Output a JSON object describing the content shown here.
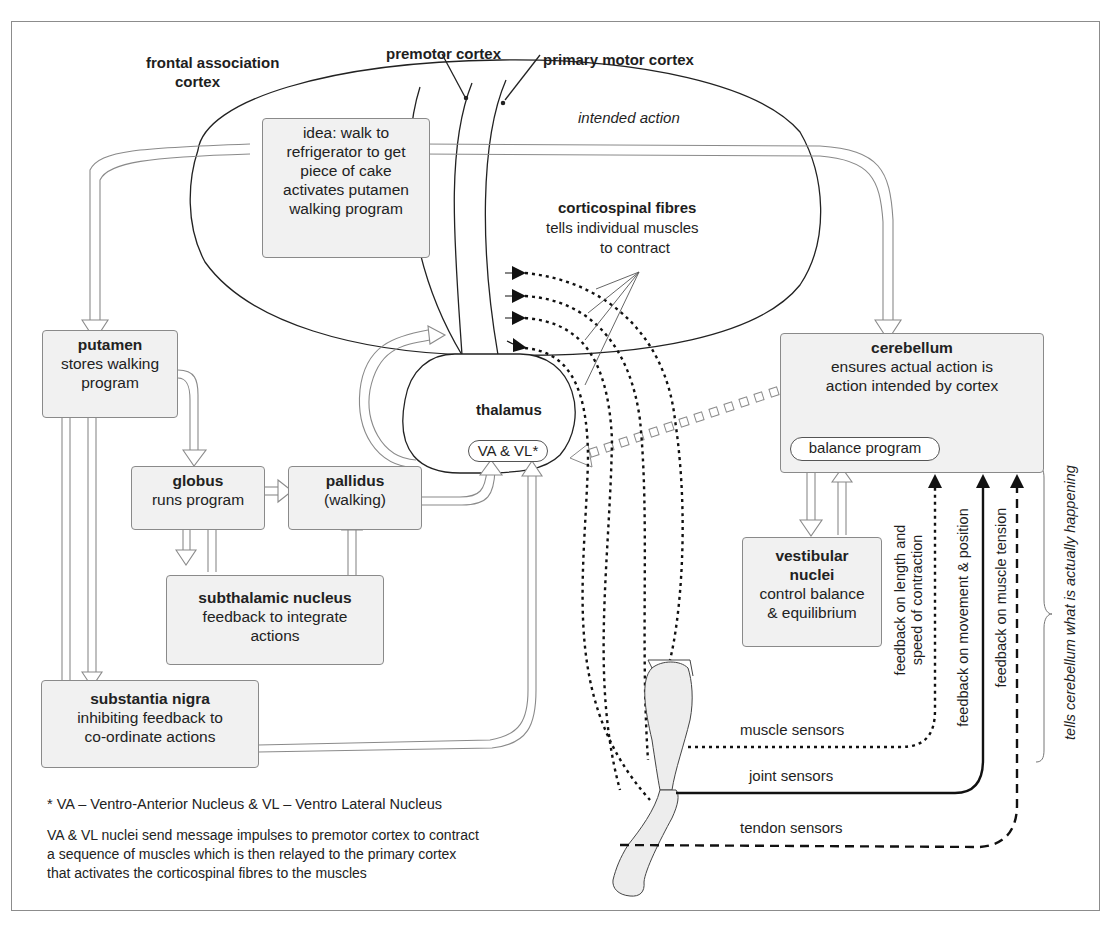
{
  "labels": {
    "frontal_association_cortex": [
      "frontal association",
      "cortex"
    ],
    "premotor_cortex": "premotor cortex",
    "primary_motor_cortex": "primary motor cortex",
    "intended_action": "intended action",
    "corticospinal_title": "corticospinal fibres",
    "corticospinal_desc": [
      "tells individual muscles",
      "to contract"
    ],
    "thalamus": "thalamus",
    "va_vl": "VA & VL*",
    "balance_program": "balance program",
    "muscle_sensors": "muscle sensors",
    "joint_sensors": "joint sensors",
    "tendon_sensors": "tendon sensors",
    "feedback_length": [
      "feedback on length and",
      "speed of contraction"
    ],
    "feedback_movement": "feedback on movement & position",
    "feedback_tension": "feedback on muscle  tension",
    "tells_cerebellum": "tells cerebellum what is actually happening"
  },
  "boxes": {
    "idea": {
      "lines": [
        "idea: walk to",
        "refrigerator to get",
        "piece of cake",
        "activates putamen",
        "walking program"
      ]
    },
    "putamen": {
      "title": "putamen",
      "lines": [
        "stores walking",
        "program"
      ]
    },
    "globus": {
      "title": "globus",
      "lines": [
        "runs program"
      ]
    },
    "pallidus": {
      "title": "pallidus",
      "lines": [
        "(walking)"
      ]
    },
    "subthalamic": {
      "title": "subthalamic nucleus",
      "lines": [
        "feedback to integrate",
        "actions"
      ]
    },
    "substantia": {
      "title": "substantia nigra",
      "lines": [
        "inhibiting feedback to",
        "co-ordinate actions"
      ]
    },
    "cerebellum": {
      "title": "cerebellum",
      "lines": [
        "ensures actual action is",
        "action intended by cortex"
      ]
    },
    "vestibular": {
      "title_lines": [
        "vestibular",
        "nuclei"
      ],
      "lines": [
        "control balance",
        "& equilibrium"
      ]
    }
  },
  "footnote": {
    "definition": "* VA – Ventro-Anterior Nucleus & VL – Ventro Lateral Nucleus",
    "explanation": [
      "VA & VL nuclei send message impulses to premotor cortex to contract",
      "a sequence of muscles which is then relayed to the primary cortex",
      "that  activates the corticospinal fibres to the muscles"
    ]
  },
  "colors": {
    "box_fill": "#f1f1f1",
    "box_border": "#8a8a8a",
    "line": "#222222",
    "hollow_arrow": "#8a8a8a",
    "frame": "#8c8c8c"
  }
}
